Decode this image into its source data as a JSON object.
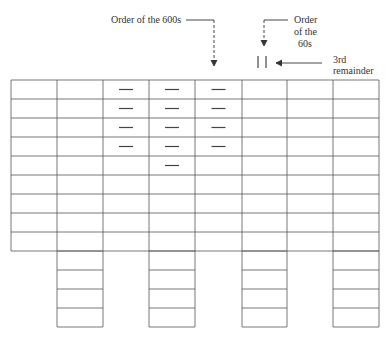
{
  "annotations": {
    "order_600s": "Order of the 600s",
    "order_60s_line1": "Order",
    "order_60s_line2": "of the",
    "order_60s_line3": "60s",
    "remainder_line1": "3rd",
    "remainder_line2": "remainder"
  },
  "grid": {
    "columns": 8,
    "rows": 9,
    "col_x": [
      11,
      57,
      103,
      149,
      195,
      242,
      287,
      333,
      379
    ],
    "row_y": [
      80,
      99,
      118,
      137,
      156,
      175,
      194,
      213,
      232,
      251
    ],
    "dash_marks": [
      {
        "col": 2,
        "rows": [
          0,
          1,
          2,
          3
        ]
      },
      {
        "col": 3,
        "rows": [
          0,
          1,
          2,
          3,
          4
        ]
      },
      {
        "col": 4,
        "rows": [
          0,
          1,
          2,
          3
        ]
      }
    ],
    "tally_marks": {
      "count": 2,
      "col": 5
    }
  },
  "sub_tables": {
    "columns": [
      1,
      3,
      5,
      7
    ],
    "rows": 4,
    "row_y": [
      251,
      270,
      289,
      308,
      327
    ]
  },
  "colors": {
    "line": "#555555",
    "text": "#333333"
  }
}
